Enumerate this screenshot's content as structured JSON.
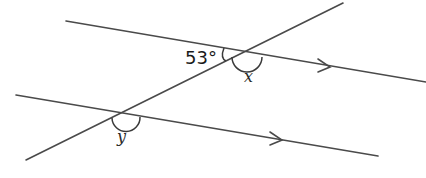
{
  "diagram": {
    "type": "parallel lines cut by a transversal",
    "lines": {
      "top_parallel": {
        "x1": 66,
        "y1": 21,
        "x2": 426,
        "y2": 82
      },
      "bottom_parallel": {
        "x1": 16,
        "y1": 95,
        "x2": 378,
        "y2": 156
      },
      "transversal": {
        "x1": 26,
        "y1": 160,
        "x2": 343,
        "y2": 3
      }
    },
    "arrows": [
      {
        "name": "top-parallel-arrow",
        "x": 330,
        "y": 67
      },
      {
        "name": "bottom-parallel-arrow",
        "x": 282,
        "y": 140
      }
    ],
    "intersections": {
      "top": {
        "x": 243,
        "y": 52
      },
      "bottom": {
        "x": 123,
        "y": 113
      }
    },
    "labels": {
      "given_angle": "53°",
      "angle_x": "x",
      "angle_y": "y"
    },
    "colors": {
      "line": "#4a4a4a",
      "text": "#1a1a1a",
      "background": "#ffffff"
    }
  }
}
